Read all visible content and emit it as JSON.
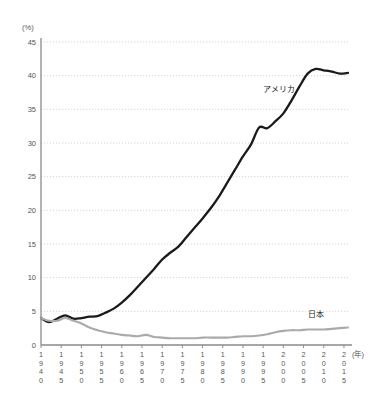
{
  "chart_data": {
    "type": "line",
    "title": "",
    "subtitle": "",
    "xlabel": "(年)",
    "ylabel": "(%)",
    "ylim": [
      0,
      45
    ],
    "xlim": [
      1940,
      2016
    ],
    "grid": true,
    "legend_position": "inline-annotation",
    "y_ticks": [
      "0",
      "5",
      "10",
      "15",
      "20",
      "25",
      "30",
      "35",
      "40",
      "45"
    ],
    "y_tick_values": [
      0,
      5,
      10,
      15,
      20,
      25,
      30,
      35,
      40,
      45
    ],
    "x_ticks": [
      "1940",
      "1945",
      "1950",
      "1955",
      "1960",
      "1965",
      "1970",
      "1975",
      "1980",
      "1985",
      "1990",
      "1995",
      "2000",
      "2005",
      "2010",
      "2015"
    ],
    "x_tick_values": [
      1940,
      1945,
      1950,
      1955,
      1960,
      1965,
      1970,
      1975,
      1980,
      1985,
      1990,
      1995,
      2000,
      2005,
      2010,
      2015
    ],
    "series": [
      {
        "name": "アメリカ",
        "color": "#1a1a1a",
        "label_x": 1999,
        "label_y": 37.6,
        "x": [
          1940,
          1942,
          1944,
          1946,
          1948,
          1950,
          1952,
          1954,
          1956,
          1958,
          1960,
          1962,
          1964,
          1966,
          1968,
          1970,
          1972,
          1974,
          1976,
          1978,
          1980,
          1982,
          1984,
          1986,
          1988,
          1990,
          1992,
          1994,
          1996,
          1998,
          2000,
          2002,
          2004,
          2006,
          2008,
          2010,
          2012,
          2014,
          2016
        ],
        "values": [
          4.0,
          3.4,
          3.9,
          4.4,
          3.9,
          4.0,
          4.2,
          4.3,
          4.8,
          5.4,
          6.3,
          7.4,
          8.7,
          10.0,
          11.3,
          12.7,
          13.7,
          14.6,
          16.0,
          17.4,
          18.8,
          20.3,
          22.0,
          24.0,
          26.0,
          28.0,
          29.8,
          32.3,
          32.2,
          33.2,
          34.4,
          36.3,
          38.4,
          40.3,
          41.0,
          40.8,
          40.6,
          40.3,
          40.4
        ]
      },
      {
        "name": "日本",
        "color": "#aaaaaa",
        "label_x": 2008,
        "label_y": 4.1,
        "x": [
          1940,
          1942,
          1944,
          1946,
          1948,
          1950,
          1952,
          1954,
          1956,
          1958,
          1960,
          1962,
          1964,
          1966,
          1968,
          1970,
          1972,
          1974,
          1976,
          1978,
          1980,
          1982,
          1984,
          1986,
          1988,
          1990,
          1992,
          1994,
          1996,
          1998,
          2000,
          2002,
          2004,
          2006,
          2008,
          2010,
          2012,
          2014,
          2016
        ],
        "values": [
          4.0,
          3.6,
          3.6,
          4.0,
          3.6,
          3.2,
          2.6,
          2.2,
          1.9,
          1.7,
          1.5,
          1.4,
          1.3,
          1.5,
          1.2,
          1.1,
          1.0,
          1.0,
          1.0,
          1.0,
          1.1,
          1.1,
          1.1,
          1.1,
          1.2,
          1.3,
          1.3,
          1.4,
          1.6,
          1.9,
          2.1,
          2.2,
          2.2,
          2.3,
          2.3,
          2.3,
          2.4,
          2.5,
          2.6
        ]
      }
    ]
  },
  "axis": {
    "y_unit": "(%)",
    "x_unit": "(年)"
  },
  "colors": {
    "america_line": "#1a1a1a",
    "japan_line": "#aaaaaa",
    "axis": "#8a8a8a",
    "grid": "#c9c9c9",
    "text": "#555555",
    "background": "#ffffff"
  }
}
